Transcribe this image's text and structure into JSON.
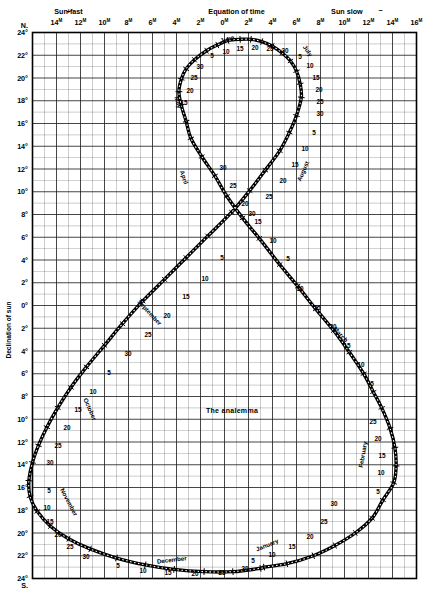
{
  "figure": {
    "title": "The analemma",
    "top_axis_title": "Equation of time",
    "top_left_group": "Sun fast",
    "top_right_group": "Sun slow",
    "plus_sign": "+",
    "minus_sign": "−",
    "left_axis_title": "Declination of sun",
    "north_marker": "N.",
    "south_marker": "S.",
    "degree_symbol": "°",
    "minute_symbol": "M"
  },
  "chart_data": {
    "type": "scatter",
    "title": "The analemma",
    "xlabel": "Equation of time",
    "ylabel": "Declination of sun",
    "xlim": [
      -16,
      16
    ],
    "ylim": [
      -24,
      24
    ],
    "grid": true,
    "legend": "none",
    "x_tick_labels": [
      "16",
      "14",
      "12",
      "10",
      "8",
      "6",
      "4",
      "2",
      "0",
      "2",
      "4",
      "6",
      "8",
      "10",
      "12",
      "14"
    ],
    "x_tick_values": [
      -16,
      -14,
      -12,
      -10,
      -8,
      -6,
      -4,
      -2,
      0,
      2,
      4,
      6,
      8,
      10,
      12,
      14
    ],
    "x_tick_suffix": "M",
    "x_sign_note": {
      "left": "Sun fast (+)",
      "right": "Sun slow (−)"
    },
    "y_tick_labels": [
      "24",
      "22",
      "20",
      "18",
      "16",
      "14",
      "12",
      "10",
      "8",
      "6",
      "4",
      "2",
      "0",
      "2",
      "4",
      "6",
      "8",
      "10",
      "12",
      "14",
      "16",
      "18",
      "20",
      "22",
      "24"
    ],
    "y_tick_values": [
      24,
      22,
      20,
      18,
      16,
      14,
      12,
      10,
      8,
      6,
      4,
      2,
      0,
      -2,
      -4,
      -6,
      -8,
      -10,
      -12,
      -14,
      -16,
      -18,
      -20,
      -22,
      -24
    ],
    "y_tick_suffix": "°",
    "y_hemisphere": {
      "top": "N.",
      "bottom": "S."
    },
    "series_name": "Sun position (equation of time vs declination) through the year",
    "points": [
      {
        "date": "Jan 1",
        "eot": -3.3,
        "dec": -23.0
      },
      {
        "date": "Jan 5",
        "eot": -5.2,
        "dec": -22.7
      },
      {
        "date": "Jan 10",
        "eot": -7.4,
        "dec": -22.0
      },
      {
        "date": "Jan 15",
        "eot": -9.2,
        "dec": -21.1
      },
      {
        "date": "Jan 20",
        "eot": -10.9,
        "dec": -20.0
      },
      {
        "date": "Jan 25",
        "eot": -12.3,
        "dec": -18.7
      },
      {
        "date": "Jan 30",
        "eot": -13.2,
        "dec": -17.1
      },
      {
        "date": "Feb 5",
        "eot": -14.1,
        "dec": -15.6
      },
      {
        "date": "Feb 10",
        "eot": -14.3,
        "dec": -14.1
      },
      {
        "date": "Feb 15",
        "eot": -14.2,
        "dec": -12.5
      },
      {
        "date": "Feb 20",
        "eot": -13.8,
        "dec": -10.8
      },
      {
        "date": "Feb 25",
        "eot": -13.1,
        "dec": -9.0
      },
      {
        "date": "Mar 1",
        "eot": -12.4,
        "dec": -7.6
      },
      {
        "date": "Mar 5",
        "eot": -11.6,
        "dec": -6.0
      },
      {
        "date": "Mar 10",
        "eot": -10.4,
        "dec": -4.1
      },
      {
        "date": "Mar 15",
        "eot": -9.1,
        "dec": -2.2
      },
      {
        "date": "Mar 20",
        "eot": -7.6,
        "dec": -0.3
      },
      {
        "date": "Mar 25",
        "eot": -6.1,
        "dec": 1.7
      },
      {
        "date": "Mar 30",
        "eot": -4.6,
        "dec": 3.6
      },
      {
        "date": "Apr 5",
        "eot": -2.9,
        "dec": 5.9
      },
      {
        "date": "Apr 10",
        "eot": -1.5,
        "dec": 7.7
      },
      {
        "date": "Apr 15",
        "eot": -0.2,
        "dec": 9.6
      },
      {
        "date": "Apr 20",
        "eot": 0.8,
        "dec": 11.4
      },
      {
        "date": "Apr 25",
        "eot": 1.9,
        "dec": 13.1
      },
      {
        "date": "Apr 30",
        "eot": 2.8,
        "dec": 14.7
      },
      {
        "date": "May 5",
        "eot": 3.2,
        "dec": 16.2
      },
      {
        "date": "May 10",
        "eot": 3.6,
        "dec": 17.6
      },
      {
        "date": "May 15",
        "eot": 3.8,
        "dec": 18.8
      },
      {
        "date": "May 20",
        "eot": 3.6,
        "dec": 19.9
      },
      {
        "date": "May 25",
        "eot": 3.2,
        "dec": 20.8
      },
      {
        "date": "May 30",
        "eot": 2.5,
        "dec": 21.6
      },
      {
        "date": "Jun 5",
        "eot": 1.5,
        "dec": 22.4
      },
      {
        "date": "Jun 10",
        "eot": 0.6,
        "dec": 22.9
      },
      {
        "date": "Jun 15",
        "eot": -0.3,
        "dec": 23.3
      },
      {
        "date": "Jun 20",
        "eot": -1.3,
        "dec": 23.4
      },
      {
        "date": "Jun 25",
        "eot": -2.2,
        "dec": 23.4
      },
      {
        "date": "Jun 30",
        "eot": -3.1,
        "dec": 23.2
      },
      {
        "date": "Jul 5",
        "eot": -4.0,
        "dec": 22.8
      },
      {
        "date": "Jul 10",
        "eot": -4.8,
        "dec": 22.2
      },
      {
        "date": "Jul 15",
        "eot": -5.5,
        "dec": 21.5
      },
      {
        "date": "Jul 20",
        "eot": -6.0,
        "dec": 20.6
      },
      {
        "date": "Jul 25",
        "eot": -6.3,
        "dec": 19.5
      },
      {
        "date": "Jul 30",
        "eot": -6.4,
        "dec": 18.3
      },
      {
        "date": "Aug 5",
        "eot": -6.0,
        "dec": 16.7
      },
      {
        "date": "Aug 10",
        "eot": -5.4,
        "dec": 15.2
      },
      {
        "date": "Aug 15",
        "eot": -4.6,
        "dec": 13.6
      },
      {
        "date": "Aug 20",
        "eot": -3.4,
        "dec": 11.9
      },
      {
        "date": "Aug 25",
        "eot": -2.1,
        "dec": 10.1
      },
      {
        "date": "Aug 30",
        "eot": -0.6,
        "dec": 8.2
      },
      {
        "date": "Sep 5",
        "eot": 1.4,
        "dec": 6.1
      },
      {
        "date": "Sep 10",
        "eot": 3.2,
        "dec": 4.2
      },
      {
        "date": "Sep 15",
        "eot": 5.0,
        "dec": 2.3
      },
      {
        "date": "Sep 20",
        "eot": 6.8,
        "dec": 0.4
      },
      {
        "date": "Sep 25",
        "eot": 8.5,
        "dec": -1.6
      },
      {
        "date": "Sep 30",
        "eot": 10.0,
        "dec": -3.5
      },
      {
        "date": "Oct 5",
        "eot": 11.5,
        "dec": -5.4
      },
      {
        "date": "Oct 10",
        "eot": 12.8,
        "dec": -7.2
      },
      {
        "date": "Oct 15",
        "eot": 13.9,
        "dec": -9.0
      },
      {
        "date": "Oct 20",
        "eot": 14.8,
        "dec": -10.7
      },
      {
        "date": "Oct 25",
        "eot": 15.5,
        "dec": -12.3
      },
      {
        "date": "Oct 30",
        "eot": 16.0,
        "dec": -13.8
      },
      {
        "date": "Nov 5",
        "eot": 16.3,
        "dec": -15.4
      },
      {
        "date": "Nov 10",
        "eot": 16.2,
        "dec": -16.8
      },
      {
        "date": "Nov 15",
        "eot": 15.6,
        "dec": -18.1
      },
      {
        "date": "Nov 20",
        "eot": 14.5,
        "dec": -19.4
      },
      {
        "date": "Nov 25",
        "eot": 13.0,
        "dec": -20.5
      },
      {
        "date": "Nov 30",
        "eot": 11.2,
        "dec": -21.4
      },
      {
        "date": "Dec 5",
        "eot": 9.0,
        "dec": -22.2
      },
      {
        "date": "Dec 10",
        "eot": 6.6,
        "dec": -22.8
      },
      {
        "date": "Dec 15",
        "eot": 4.2,
        "dec": -23.2
      },
      {
        "date": "Dec 20",
        "eot": 1.7,
        "dec": -23.4
      },
      {
        "date": "Dec 25",
        "eot": -0.7,
        "dec": -23.4
      },
      {
        "date": "Dec 30",
        "eot": -3.0,
        "dec": -23.1
      }
    ],
    "day_tick_labels": [
      {
        "month": "January",
        "text": "5",
        "x": 253,
        "y": 563
      },
      {
        "month": "January",
        "text": "10",
        "x": 272,
        "y": 557
      },
      {
        "month": "January",
        "text": "15",
        "x": 292,
        "y": 549
      },
      {
        "month": "January",
        "text": "20",
        "x": 310,
        "y": 539
      },
      {
        "month": "January",
        "text": "25",
        "x": 324,
        "y": 524
      },
      {
        "month": "January",
        "text": "30",
        "x": 334,
        "y": 506
      },
      {
        "month": "February",
        "text": "5",
        "x": 378,
        "y": 494
      },
      {
        "month": "February",
        "text": "10",
        "x": 381,
        "y": 475
      },
      {
        "month": "February",
        "text": "15",
        "x": 382,
        "y": 458
      },
      {
        "month": "February",
        "text": "20",
        "x": 378,
        "y": 441
      },
      {
        "month": "February",
        "text": "25",
        "x": 373,
        "y": 424
      },
      {
        "month": "March",
        "text": "5",
        "x": 372,
        "y": 386
      },
      {
        "month": "March",
        "text": "10",
        "x": 361,
        "y": 367
      },
      {
        "month": "March",
        "text": "15",
        "x": 347,
        "y": 348
      },
      {
        "month": "March",
        "text": "20",
        "x": 333,
        "y": 329
      },
      {
        "month": "March",
        "text": "25",
        "x": 317,
        "y": 310
      },
      {
        "month": "March",
        "text": "30",
        "x": 300,
        "y": 291
      },
      {
        "month": "April",
        "text": "5",
        "x": 288,
        "y": 261
      },
      {
        "month": "April",
        "text": "10",
        "x": 273,
        "y": 243
      },
      {
        "month": "April",
        "text": "15",
        "x": 258,
        "y": 224
      },
      {
        "month": "April",
        "text": "20",
        "x": 245,
        "y": 206
      },
      {
        "month": "April",
        "text": "25",
        "x": 233,
        "y": 188
      },
      {
        "month": "April",
        "text": "30",
        "x": 223,
        "y": 170
      },
      {
        "month": "May",
        "text": "15",
        "x": 184,
        "y": 105
      },
      {
        "month": "May",
        "text": "20",
        "x": 190,
        "y": 93
      },
      {
        "month": "May",
        "text": "25",
        "x": 194,
        "y": 80
      },
      {
        "month": "May",
        "text": "30",
        "x": 200,
        "y": 69
      },
      {
        "month": "June",
        "text": "5",
        "x": 212,
        "y": 58
      },
      {
        "month": "June",
        "text": "10",
        "x": 226,
        "y": 54
      },
      {
        "month": "June",
        "text": "15",
        "x": 240,
        "y": 51
      },
      {
        "month": "June",
        "text": "20",
        "x": 255,
        "y": 50
      },
      {
        "month": "June",
        "text": "25",
        "x": 270,
        "y": 51
      },
      {
        "month": "June",
        "text": "30",
        "x": 285,
        "y": 53
      },
      {
        "month": "July",
        "text": "5",
        "x": 300,
        "y": 59
      },
      {
        "month": "July",
        "text": "10",
        "x": 310,
        "y": 68
      },
      {
        "month": "July",
        "text": "15",
        "x": 316,
        "y": 80
      },
      {
        "month": "July",
        "text": "20",
        "x": 319,
        "y": 92
      },
      {
        "month": "July",
        "text": "25",
        "x": 320,
        "y": 104
      },
      {
        "month": "July",
        "text": "30",
        "x": 320,
        "y": 116
      },
      {
        "month": "August",
        "text": "5",
        "x": 314,
        "y": 135
      },
      {
        "month": "August",
        "text": "10",
        "x": 305,
        "y": 151
      },
      {
        "month": "August",
        "text": "15",
        "x": 295,
        "y": 167
      },
      {
        "month": "August",
        "text": "20",
        "x": 283,
        "y": 183
      },
      {
        "month": "August",
        "text": "25",
        "x": 269,
        "y": 199
      },
      {
        "month": "August",
        "text": "30",
        "x": 252,
        "y": 216
      },
      {
        "month": "September",
        "text": "5",
        "x": 222,
        "y": 260
      },
      {
        "month": "September",
        "text": "10",
        "x": 205,
        "y": 281
      },
      {
        "month": "September",
        "text": "15",
        "x": 186,
        "y": 299
      },
      {
        "month": "September",
        "text": "20",
        "x": 167,
        "y": 318
      },
      {
        "month": "September",
        "text": "25",
        "x": 148,
        "y": 337
      },
      {
        "month": "September",
        "text": "30",
        "x": 128,
        "y": 356
      },
      {
        "month": "October",
        "text": "5",
        "x": 109,
        "y": 375
      },
      {
        "month": "October",
        "text": "10",
        "x": 93,
        "y": 394
      },
      {
        "month": "October",
        "text": "15",
        "x": 78,
        "y": 412
      },
      {
        "month": "October",
        "text": "20",
        "x": 67,
        "y": 430
      },
      {
        "month": "October",
        "text": "25",
        "x": 58,
        "y": 448
      },
      {
        "month": "October",
        "text": "30",
        "x": 50,
        "y": 465
      },
      {
        "month": "November",
        "text": "5",
        "x": 49,
        "y": 493
      },
      {
        "month": "November",
        "text": "10",
        "x": 47,
        "y": 510
      },
      {
        "month": "November",
        "text": "15",
        "x": 50,
        "y": 524
      },
      {
        "month": "November",
        "text": "20",
        "x": 58,
        "y": 537
      },
      {
        "month": "November",
        "text": "25",
        "x": 70,
        "y": 549
      },
      {
        "month": "November",
        "text": "30",
        "x": 86,
        "y": 559
      },
      {
        "month": "December",
        "text": "5",
        "x": 118,
        "y": 568
      },
      {
        "month": "December",
        "text": "10",
        "x": 143,
        "y": 573
      },
      {
        "month": "December",
        "text": "15",
        "x": 168,
        "y": 575
      },
      {
        "month": "December",
        "text": "20",
        "x": 195,
        "y": 576
      },
      {
        "month": "December",
        "text": "25",
        "x": 222,
        "y": 575
      },
      {
        "month": "December",
        "text": "30",
        "x": 245,
        "y": 571
      }
    ],
    "month_labels": [
      {
        "text": "January",
        "x": 268,
        "y": 547,
        "rotate": -22
      },
      {
        "text": "February",
        "x": 365,
        "y": 455,
        "rotate": -80
      },
      {
        "text": "March",
        "x": 339,
        "y": 336,
        "rotate": 47
      },
      {
        "text": "April",
        "x": 182,
        "y": 178,
        "rotate": 72
      },
      {
        "text": "May",
        "x": 176,
        "y": 103,
        "rotate": 72
      },
      {
        "text": "June",
        "x": 228,
        "y": 41,
        "rotate": -17
      },
      {
        "text": "July",
        "x": 306,
        "y": 52,
        "rotate": 55
      },
      {
        "text": "August",
        "x": 305,
        "y": 172,
        "rotate": -66
      },
      {
        "text": "September",
        "x": 148,
        "y": 314,
        "rotate": 47
      },
      {
        "text": "October",
        "x": 88,
        "y": 410,
        "rotate": 66
      },
      {
        "text": "November",
        "x": 67,
        "y": 503,
        "rotate": 62
      },
      {
        "text": "December",
        "x": 172,
        "y": 562,
        "rotate": -7
      }
    ]
  }
}
